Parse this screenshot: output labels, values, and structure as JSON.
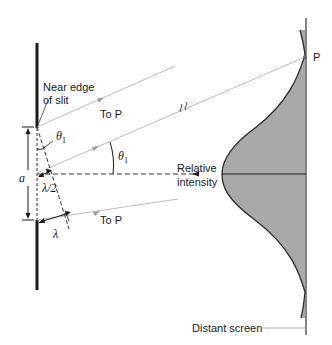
{
  "diagram": {
    "labels": {
      "near_edge": [
        "Near edge",
        "of slit"
      ],
      "to_p_top": "To P",
      "to_p_bottom": "To P",
      "theta_small": "θ",
      "theta_small_sub": "1",
      "theta_big": "θ",
      "theta_big_sub": "1",
      "slit_width": "a",
      "half_wavelength": "λ/2",
      "wavelength": "λ",
      "relative_intensity": [
        "Relative",
        "intensity"
      ],
      "point_p": "P",
      "distant_screen": "Distant screen"
    },
    "colors": {
      "wall": "#1a1a1a",
      "ray": "#bdbdbd",
      "ray_arrow": "#9a9a9a",
      "curve_fill": "#a9a9a9",
      "curve_stroke": "#2a2a2a",
      "screen": "#333333",
      "dash": "#333333"
    },
    "break_symbol": "≀≀"
  }
}
